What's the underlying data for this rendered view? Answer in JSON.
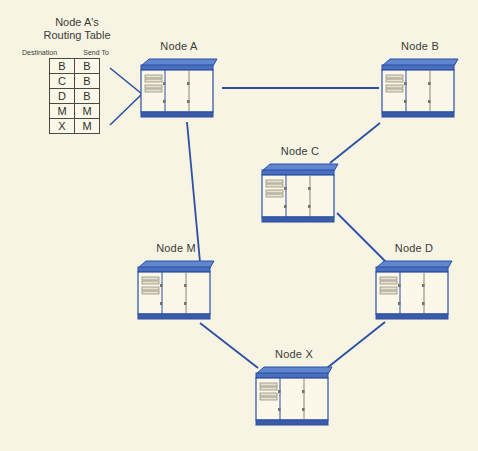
{
  "diagram": {
    "background_color": "#f7f4e4",
    "line_color": "#2b4fa2",
    "node_body_color": "#fbf8ea",
    "node_top_color": "#4a6fbf",
    "node_outline_color": "#2b4fa2"
  },
  "routing_table": {
    "title_line1": "Node A's",
    "title_line2": "Routing Table",
    "columns": [
      "Destination",
      "Send To"
    ],
    "rows": [
      {
        "destination": "B",
        "send_to": "B"
      },
      {
        "destination": "C",
        "send_to": "B"
      },
      {
        "destination": "D",
        "send_to": "B"
      },
      {
        "destination": "M",
        "send_to": "M"
      },
      {
        "destination": "X",
        "send_to": "M"
      }
    ]
  },
  "nodes": [
    {
      "id": "A",
      "label": "Node A",
      "x": 137,
      "y": 40
    },
    {
      "id": "B",
      "label": "Node B",
      "x": 378,
      "y": 40
    },
    {
      "id": "C",
      "label": "Node C",
      "x": 258,
      "y": 145
    },
    {
      "id": "D",
      "label": "Node D",
      "x": 372,
      "y": 242
    },
    {
      "id": "M",
      "label": "Node M",
      "x": 134,
      "y": 242
    },
    {
      "id": "X",
      "label": "Node X",
      "x": 252,
      "y": 348
    }
  ],
  "links": [
    {
      "from": "A",
      "to": "B"
    },
    {
      "from": "A",
      "to": "M"
    },
    {
      "from": "B",
      "to": "C"
    },
    {
      "from": "C",
      "to": "D"
    },
    {
      "from": "D",
      "to": "X"
    },
    {
      "from": "M",
      "to": "X"
    }
  ]
}
